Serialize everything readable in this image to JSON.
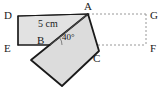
{
  "figure": {
    "type": "geometry-diagram",
    "canvas": {
      "width": 165,
      "height": 91,
      "background": "#ffffff"
    },
    "style": {
      "shape_fill": "#e2e2e2",
      "shape_fill_alt": "#dcdcdc",
      "stroke": "#1a1a1a",
      "dashed_stroke": "#8c8c8c",
      "solid_width": 1.2,
      "bold_width": 1.8,
      "dash_pattern": "2,2"
    },
    "shapes": [
      {
        "name": "upright-rectangle",
        "role": "original-rectangle",
        "fill": "#e2e2e2",
        "points": "18,16 88,14 92,45 18,45"
      },
      {
        "name": "rotated-rectangle",
        "role": "rotated-rectangle",
        "fill": "#dcdcdc",
        "points": "88,14 99,51 62,86 31,60"
      }
    ],
    "segments": [
      {
        "name": "diagonal-B-to-A",
        "from": "50,45",
        "to": "88,14",
        "style": "thin"
      },
      {
        "name": "edge-D-to-A",
        "from": "18,16",
        "to": "88,14",
        "style": "solid"
      },
      {
        "name": "edge-D-to-E",
        "from": "18,16",
        "to": "18,45",
        "style": "solid"
      },
      {
        "name": "edge-E-to-B",
        "from": "18,45",
        "to": "50,45",
        "style": "solid"
      }
    ],
    "dashed_segments": [
      {
        "name": "dashed-A-to-G",
        "from": "88,14",
        "to": "146,14"
      },
      {
        "name": "dashed-B-to-F",
        "from": "50,45",
        "to": "146,45"
      },
      {
        "name": "dashed-G-to-F",
        "from": "146,14",
        "to": "146,45"
      }
    ],
    "vertex_labels": [
      {
        "name": "vertex-label-D",
        "text": "D",
        "x": 4,
        "y": 10
      },
      {
        "name": "vertex-label-A",
        "text": "A",
        "x": 84,
        "y": 1
      },
      {
        "name": "vertex-label-G",
        "text": "G",
        "x": 150,
        "y": 10
      },
      {
        "name": "vertex-label-E",
        "text": "E",
        "x": 4,
        "y": 43
      },
      {
        "name": "vertex-label-B",
        "text": "B",
        "x": 37,
        "y": 35
      },
      {
        "name": "vertex-label-C",
        "text": "C",
        "x": 93,
        "y": 53
      },
      {
        "name": "vertex-label-F",
        "text": "F",
        "x": 150,
        "y": 43
      }
    ],
    "measurements": [
      {
        "name": "length-label-5cm",
        "text": "5 cm",
        "x": 38,
        "y": 19
      }
    ],
    "angles": [
      {
        "name": "angle-label-40deg",
        "text": "40°",
        "x": 62,
        "y": 33,
        "vertex": "B",
        "value": 40,
        "unit": "degrees"
      }
    ]
  }
}
